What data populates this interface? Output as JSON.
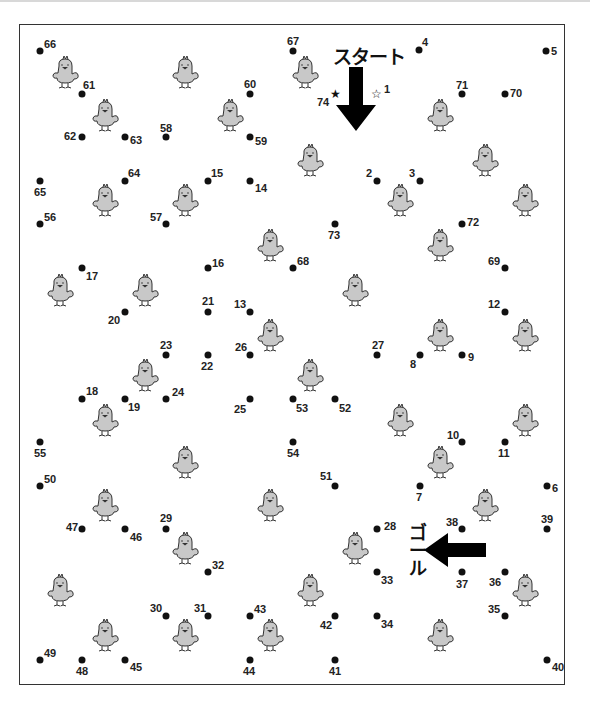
{
  "puzzle": {
    "type": "dot-to-dot",
    "start_label": "スタート",
    "goal_label_lines": [
      "ゴ",
      "ー",
      "ル"
    ],
    "start_number": 1,
    "end_number": 74,
    "start_marker": "white-star",
    "end_marker": "black-star"
  },
  "dots": [
    {
      "n": "1",
      "x": 376,
      "y": 94,
      "lx": 384,
      "ly": 84,
      "marker": "open-star"
    },
    {
      "n": "2",
      "x": 377,
      "y": 181,
      "lx": 366,
      "ly": 168
    },
    {
      "n": "3",
      "x": 420,
      "y": 181,
      "lx": 409,
      "ly": 168
    },
    {
      "n": "4",
      "x": 419,
      "y": 50,
      "lx": 422,
      "ly": 37
    },
    {
      "n": "5",
      "x": 546,
      "y": 51,
      "lx": 551,
      "ly": 46
    },
    {
      "n": "6",
      "x": 547,
      "y": 486,
      "lx": 552,
      "ly": 483
    },
    {
      "n": "7",
      "x": 420,
      "y": 486,
      "lx": 416,
      "ly": 492
    },
    {
      "n": "8",
      "x": 420,
      "y": 355,
      "lx": 410,
      "ly": 359
    },
    {
      "n": "9",
      "x": 462,
      "y": 355,
      "lx": 468,
      "ly": 352
    },
    {
      "n": "10",
      "x": 462,
      "y": 442,
      "lx": 447,
      "ly": 430
    },
    {
      "n": "11",
      "x": 505,
      "y": 442,
      "lx": 498,
      "ly": 448
    },
    {
      "n": "12",
      "x": 505,
      "y": 312,
      "lx": 488,
      "ly": 299
    },
    {
      "n": "13",
      "x": 250,
      "y": 312,
      "lx": 234,
      "ly": 299
    },
    {
      "n": "14",
      "x": 250,
      "y": 181,
      "lx": 255,
      "ly": 183
    },
    {
      "n": "15",
      "x": 208,
      "y": 181,
      "lx": 211,
      "ly": 168
    },
    {
      "n": "16",
      "x": 208,
      "y": 268,
      "lx": 212,
      "ly": 258
    },
    {
      "n": "17",
      "x": 82,
      "y": 268,
      "lx": 86,
      "ly": 271
    },
    {
      "n": "18",
      "x": 82,
      "y": 399,
      "lx": 86,
      "ly": 386
    },
    {
      "n": "19",
      "x": 125,
      "y": 399,
      "lx": 128,
      "ly": 402
    },
    {
      "n": "20",
      "x": 125,
      "y": 312,
      "lx": 108,
      "ly": 315
    },
    {
      "n": "21",
      "x": 208,
      "y": 312,
      "lx": 202,
      "ly": 296
    },
    {
      "n": "22",
      "x": 208,
      "y": 355,
      "lx": 201,
      "ly": 361
    },
    {
      "n": "23",
      "x": 166,
      "y": 355,
      "lx": 160,
      "ly": 340
    },
    {
      "n": "24",
      "x": 166,
      "y": 399,
      "lx": 172,
      "ly": 387
    },
    {
      "n": "25",
      "x": 250,
      "y": 399,
      "lx": 234,
      "ly": 404
    },
    {
      "n": "26",
      "x": 250,
      "y": 355,
      "lx": 235,
      "ly": 342
    },
    {
      "n": "27",
      "x": 377,
      "y": 355,
      "lx": 372,
      "ly": 340
    },
    {
      "n": "28",
      "x": 377,
      "y": 529,
      "lx": 384,
      "ly": 521
    },
    {
      "n": "29",
      "x": 166,
      "y": 529,
      "lx": 160,
      "ly": 513
    },
    {
      "n": "30",
      "x": 166,
      "y": 616,
      "lx": 150,
      "ly": 603
    },
    {
      "n": "31",
      "x": 208,
      "y": 616,
      "lx": 194,
      "ly": 603
    },
    {
      "n": "32",
      "x": 208,
      "y": 572,
      "lx": 212,
      "ly": 560
    },
    {
      "n": "33",
      "x": 377,
      "y": 572,
      "lx": 381,
      "ly": 575
    },
    {
      "n": "34",
      "x": 377,
      "y": 616,
      "lx": 381,
      "ly": 619
    },
    {
      "n": "35",
      "x": 505,
      "y": 616,
      "lx": 488,
      "ly": 604
    },
    {
      "n": "36",
      "x": 505,
      "y": 572,
      "lx": 489,
      "ly": 577
    },
    {
      "n": "37",
      "x": 462,
      "y": 572,
      "lx": 456,
      "ly": 579
    },
    {
      "n": "38",
      "x": 462,
      "y": 529,
      "lx": 446,
      "ly": 517
    },
    {
      "n": "39",
      "x": 547,
      "y": 529,
      "lx": 541,
      "ly": 514
    },
    {
      "n": "40",
      "x": 547,
      "y": 660,
      "lx": 552,
      "ly": 662
    },
    {
      "n": "41",
      "x": 335,
      "y": 660,
      "lx": 329,
      "ly": 666
    },
    {
      "n": "42",
      "x": 335,
      "y": 616,
      "lx": 320,
      "ly": 620
    },
    {
      "n": "43",
      "x": 250,
      "y": 616,
      "lx": 254,
      "ly": 604
    },
    {
      "n": "44",
      "x": 250,
      "y": 660,
      "lx": 243,
      "ly": 666
    },
    {
      "n": "45",
      "x": 125,
      "y": 660,
      "lx": 130,
      "ly": 662
    },
    {
      "n": "46",
      "x": 125,
      "y": 529,
      "lx": 130,
      "ly": 532
    },
    {
      "n": "47",
      "x": 82,
      "y": 529,
      "lx": 66,
      "ly": 522
    },
    {
      "n": "48",
      "x": 82,
      "y": 660,
      "lx": 76,
      "ly": 666
    },
    {
      "n": "49",
      "x": 40,
      "y": 660,
      "lx": 44,
      "ly": 648
    },
    {
      "n": "50",
      "x": 40,
      "y": 486,
      "lx": 44,
      "ly": 474
    },
    {
      "n": "51",
      "x": 335,
      "y": 486,
      "lx": 320,
      "ly": 471
    },
    {
      "n": "52",
      "x": 335,
      "y": 399,
      "lx": 339,
      "ly": 403
    },
    {
      "n": "53",
      "x": 293,
      "y": 399,
      "lx": 296,
      "ly": 403
    },
    {
      "n": "54",
      "x": 293,
      "y": 442,
      "lx": 287,
      "ly": 448
    },
    {
      "n": "55",
      "x": 40,
      "y": 442,
      "lx": 34,
      "ly": 448
    },
    {
      "n": "56",
      "x": 40,
      "y": 224,
      "lx": 44,
      "ly": 212
    },
    {
      "n": "57",
      "x": 166,
      "y": 224,
      "lx": 150,
      "ly": 212
    },
    {
      "n": "58",
      "x": 166,
      "y": 137,
      "lx": 160,
      "ly": 123
    },
    {
      "n": "59",
      "x": 250,
      "y": 137,
      "lx": 255,
      "ly": 136
    },
    {
      "n": "60",
      "x": 250,
      "y": 94,
      "lx": 244,
      "ly": 79
    },
    {
      "n": "61",
      "x": 82,
      "y": 94,
      "lx": 83,
      "ly": 80
    },
    {
      "n": "62",
      "x": 82,
      "y": 137,
      "lx": 64,
      "ly": 131
    },
    {
      "n": "63",
      "x": 125,
      "y": 137,
      "lx": 130,
      "ly": 135
    },
    {
      "n": "64",
      "x": 125,
      "y": 181,
      "lx": 128,
      "ly": 168
    },
    {
      "n": "65",
      "x": 40,
      "y": 181,
      "lx": 34,
      "ly": 187
    },
    {
      "n": "66",
      "x": 40,
      "y": 51,
      "lx": 44,
      "ly": 39
    },
    {
      "n": "67",
      "x": 293,
      "y": 51,
      "lx": 287,
      "ly": 36
    },
    {
      "n": "68",
      "x": 293,
      "y": 268,
      "lx": 297,
      "ly": 256
    },
    {
      "n": "69",
      "x": 505,
      "y": 268,
      "lx": 488,
      "ly": 256
    },
    {
      "n": "70",
      "x": 505,
      "y": 94,
      "lx": 510,
      "ly": 88
    },
    {
      "n": "71",
      "x": 462,
      "y": 94,
      "lx": 456,
      "ly": 80
    },
    {
      "n": "72",
      "x": 462,
      "y": 224,
      "lx": 467,
      "ly": 217
    },
    {
      "n": "73",
      "x": 335,
      "y": 224,
      "lx": 328,
      "ly": 230
    },
    {
      "n": "74",
      "x": 335,
      "y": 94,
      "lx": 317,
      "ly": 97,
      "marker": "filled-star"
    }
  ],
  "chicks": [
    [
      65,
      72
    ],
    [
      185,
      72
    ],
    [
      305,
      72
    ],
    [
      105,
      115
    ],
    [
      230,
      115
    ],
    [
      440,
      115
    ],
    [
      310,
      160
    ],
    [
      485,
      160
    ],
    [
      105,
      200
    ],
    [
      185,
      200
    ],
    [
      400,
      200
    ],
    [
      525,
      200
    ],
    [
      270,
      245
    ],
    [
      440,
      245
    ],
    [
      60,
      290
    ],
    [
      145,
      290
    ],
    [
      355,
      290
    ],
    [
      270,
      335
    ],
    [
      440,
      335
    ],
    [
      525,
      335
    ],
    [
      145,
      375
    ],
    [
      310,
      375
    ],
    [
      105,
      420
    ],
    [
      400,
      420
    ],
    [
      525,
      420
    ],
    [
      185,
      462
    ],
    [
      440,
      462
    ],
    [
      105,
      505
    ],
    [
      270,
      505
    ],
    [
      485,
      505
    ],
    [
      185,
      548
    ],
    [
      355,
      548
    ],
    [
      60,
      590
    ],
    [
      310,
      590
    ],
    [
      525,
      590
    ],
    [
      105,
      635
    ],
    [
      185,
      635
    ],
    [
      270,
      635
    ],
    [
      440,
      635
    ]
  ],
  "colors": {
    "dot": "#111111",
    "chick_body": "#c8c8c8",
    "chick_outline": "#333333",
    "frame": "#333333",
    "arrow": "#000000"
  }
}
